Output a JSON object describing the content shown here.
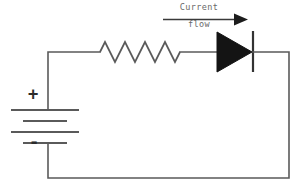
{
  "diagram": {
    "annotation": {
      "line1": "Current",
      "line2": "flow",
      "arrow_direction": "right"
    },
    "battery": {
      "positive_terminal_label": "+",
      "negative_terminal_label": "-",
      "cell_count": 2,
      "plates": [
        {
          "type": "long",
          "x1": 11,
          "x2": 79,
          "y": 110
        },
        {
          "type": "short",
          "x1": 23,
          "x2": 67,
          "y": 121
        },
        {
          "type": "long",
          "x1": 11,
          "x2": 79,
          "y": 132
        },
        {
          "type": "short",
          "x1": 23,
          "x2": 67,
          "y": 143
        }
      ]
    },
    "resistor": {
      "symbol": "zigzag",
      "peaks": 4,
      "x_start": 100,
      "x_end": 180,
      "y_center": 52,
      "amplitude": 10
    },
    "diode": {
      "symbol": "triangle-with-cathode-bar",
      "orientation": "right",
      "triangle": {
        "x_left": 217,
        "x_tip": 252,
        "y_top": 32,
        "y_bottom": 72
      },
      "cathode_bar": {
        "x": 253,
        "y_top": 31,
        "y_bottom": 72
      }
    },
    "wires": {
      "top_y": 52,
      "bottom_y": 178,
      "left_x": 48,
      "right_x": 289
    },
    "colors": {
      "wire": "#5a5a5a",
      "diode_fill": "#141414",
      "text": "#6a6a6a",
      "sign": "#2b2b2b",
      "background": "#ffffff"
    }
  }
}
